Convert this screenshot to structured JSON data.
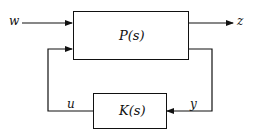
{
  "diagram": {
    "blocks": [
      {
        "id": "plant",
        "label": "P(s)"
      },
      {
        "id": "controller",
        "label": "K(s)"
      }
    ],
    "signals": {
      "w": "w",
      "z": "z",
      "u": "u",
      "y": "y"
    },
    "colors": {
      "stroke": "#111111",
      "background": "#ffffff"
    }
  }
}
